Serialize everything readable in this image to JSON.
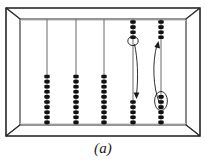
{
  "figure": {
    "caption": "(a)",
    "colors": {
      "frame_stroke": "#2b2b2b",
      "frame_fill": "#ffffff",
      "frame_shade": "#d8d8d8",
      "rod_stroke": "#555555",
      "bead_fill": "#111111",
      "arrow_stroke": "#1a1a1a",
      "highlight_stroke": "#1a1a1a"
    },
    "frame": {
      "outer": {
        "x": 6,
        "y": 8,
        "width": 194,
        "height": 128
      },
      "inner": {
        "x": 20,
        "y": 19,
        "width": 166,
        "height": 106
      }
    },
    "rods": [
      {
        "id": "rod-1",
        "x": 47,
        "top_beads": 0,
        "bottom_beads": 10
      },
      {
        "id": "rod-2",
        "x": 76,
        "top_beads": 0,
        "bottom_beads": 10
      },
      {
        "id": "rod-3",
        "x": 104,
        "top_beads": 0,
        "bottom_beads": 10
      },
      {
        "id": "rod-4",
        "x": 133,
        "top_beads": 4,
        "bottom_beads": 5
      },
      {
        "id": "rod-5",
        "x": 161,
        "top_beads": 4,
        "bottom_beads": 6
      }
    ],
    "bead": {
      "width": 5.4,
      "height": 3.6,
      "spacing": 5.1
    },
    "annotations": {
      "arrow_down": {
        "name": "bead-move-down-arrow",
        "from_rod": "rod-4",
        "direction": "down",
        "path": "M 134.5 44 C 137.5 58, 138.5 76, 136.5 95",
        "head": "M 136.5 99 L 133.6 92.5 L 139.4 92.5 Z"
      },
      "arrow_up": {
        "name": "bead-move-up-arrow",
        "from_rod": "rod-5",
        "direction": "up",
        "path": "M 159.5 103 C 153 88, 152 62, 157 45",
        "head": "M 158.5 41 L 154.4 47.1 L 160.1 48.6 Z"
      },
      "highlight_top": {
        "name": "highlighted-bead-upper",
        "rod": "rod-4",
        "cx": 133,
        "cy": 41,
        "rx": 5.2,
        "ry": 4.6
      },
      "highlight_bottom": {
        "name": "highlighted-beads-lower",
        "rod": "rod-5",
        "cx": 161,
        "cy": 101,
        "rx": 6.4,
        "ry": 9.6
      }
    }
  }
}
